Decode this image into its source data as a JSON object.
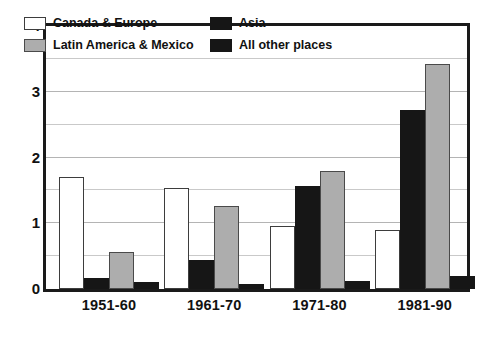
{
  "chart_data": {
    "type": "bar",
    "title": "",
    "xlabel": "",
    "ylabel": "",
    "ylim": [
      0,
      4
    ],
    "yticks": [
      0,
      1,
      2,
      3,
      4
    ],
    "ytick_labels": [
      "0",
      "1",
      "2",
      "3",
      "4"
    ],
    "grid": true,
    "grid_minor_step": 0.5,
    "legend_position": "inside-top-left",
    "categories": [
      "1951-60",
      "1961-70",
      "1971-80",
      "1981-90"
    ],
    "series": [
      {
        "name": "Canada & Europe",
        "color": "#ffffff",
        "swatch": "s-white",
        "values": [
          1.7,
          1.53,
          0.96,
          0.89
        ]
      },
      {
        "name": "Asia",
        "color": "#161616",
        "swatch": "s-black",
        "values": [
          0.17,
          0.44,
          1.56,
          2.72
        ]
      },
      {
        "name": "Latin America & Mexico",
        "color": "#adadad",
        "swatch": "s-gray",
        "values": [
          0.56,
          1.27,
          1.79,
          3.42
        ]
      },
      {
        "name": "All other places",
        "color": "#161616",
        "swatch": "s-black",
        "values": [
          0.1,
          0.07,
          0.12,
          0.2
        ]
      }
    ]
  },
  "legend": {
    "entries": [
      {
        "label": "Canada & Europe",
        "swatch": "s-white"
      },
      {
        "label": "Asia",
        "swatch": "s-black"
      },
      {
        "label": "Latin America & Mexico",
        "swatch": "s-gray"
      },
      {
        "label": "All other places",
        "swatch": "s-black"
      }
    ]
  },
  "colors": {
    "frame": "#1a1a1a",
    "gridline": "#c9c9c9",
    "text": "#111111",
    "series_white": "#ffffff",
    "series_gray": "#adadad",
    "series_black": "#161616"
  }
}
